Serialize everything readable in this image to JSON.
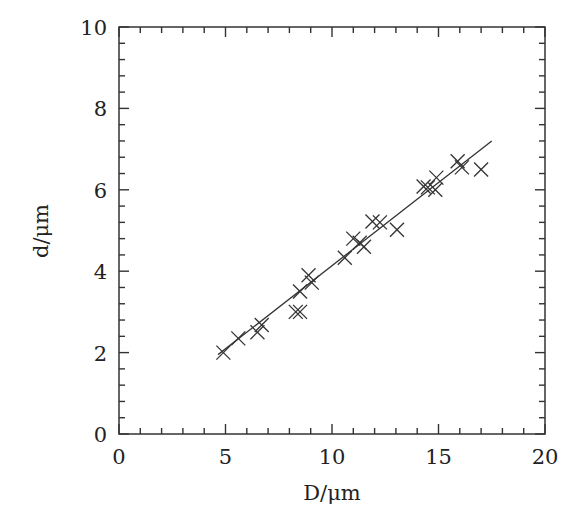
{
  "chart_data": {
    "type": "scatter",
    "title": "",
    "xlabel": "D/μm",
    "ylabel": "d/μm",
    "xlim": [
      0,
      20
    ],
    "ylim": [
      0,
      10
    ],
    "xticks": [
      0,
      5,
      10,
      15,
      20
    ],
    "yticks": [
      0,
      2,
      4,
      6,
      8,
      10
    ],
    "x_minor_step": 1,
    "y_minor_step": 0.4,
    "grid": false,
    "legend": null,
    "marker": "x",
    "series": [
      {
        "name": "data",
        "points": [
          [
            4.9,
            2.0
          ],
          [
            5.6,
            2.35
          ],
          [
            6.5,
            2.5
          ],
          [
            6.7,
            2.68
          ],
          [
            8.3,
            3.0
          ],
          [
            8.5,
            3.0
          ],
          [
            8.5,
            3.5
          ],
          [
            8.9,
            3.9
          ],
          [
            9.05,
            3.72
          ],
          [
            10.6,
            4.33
          ],
          [
            11.0,
            4.8
          ],
          [
            11.3,
            4.7
          ],
          [
            11.5,
            4.6
          ],
          [
            11.9,
            5.22
          ],
          [
            12.25,
            5.2
          ],
          [
            13.05,
            5.02
          ],
          [
            14.3,
            6.08
          ],
          [
            14.5,
            6.06
          ],
          [
            14.85,
            6.0
          ],
          [
            14.9,
            6.3
          ],
          [
            15.9,
            6.7
          ],
          [
            16.1,
            6.55
          ],
          [
            17.0,
            6.5
          ]
        ]
      },
      {
        "name": "fit",
        "type": "line",
        "points": [
          [
            4.65,
            1.95
          ],
          [
            17.5,
            7.2
          ]
        ]
      }
    ]
  }
}
